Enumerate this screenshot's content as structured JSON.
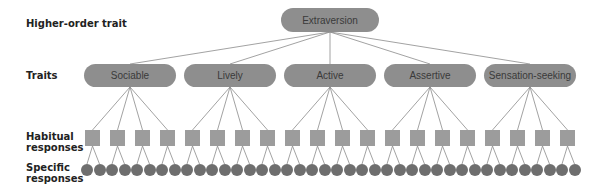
{
  "row_labels": {
    "higher": "Higher-order trait",
    "traits": "Traits",
    "habitual": "Habitual responses",
    "specific": "Specific responses"
  },
  "top": {
    "label": "Extraversion"
  },
  "traits": [
    {
      "label": "Sociable"
    },
    {
      "label": "Lively"
    },
    {
      "label": "Active"
    },
    {
      "label": "Assertive"
    },
    {
      "label": "Sensation-seeking"
    }
  ],
  "habitual_per_trait": 4,
  "specific_per_habitual": 2,
  "colors": {
    "pill": "#8e8e8e",
    "square": "#9c9c9c",
    "circle": "#6e6e6e",
    "line": "#8a8a8a"
  }
}
